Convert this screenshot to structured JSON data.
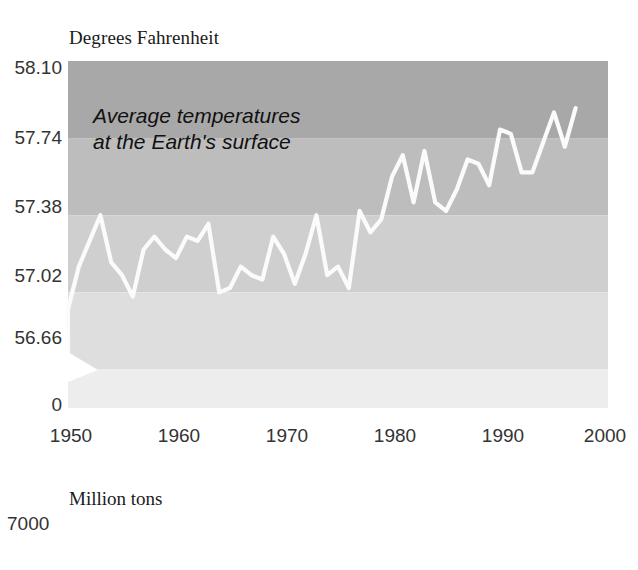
{
  "chart_data": [
    {
      "type": "line",
      "title": "Degrees Fahrenheit",
      "annotation": [
        "Average temperatures",
        "at the Earth's surface"
      ],
      "xlabel": "",
      "ylabel": "Degrees Fahrenheit",
      "yticklabels": [
        "58.10",
        "57.74",
        "57.38",
        "57.02",
        "56.66",
        "0"
      ],
      "ytickvalues": [
        58.1,
        57.74,
        57.38,
        57.02,
        56.66,
        0
      ],
      "xticklabels": [
        "1950",
        "1960",
        "1970",
        "1980",
        "1990",
        "2000"
      ],
      "xtickvalues": [
        1950,
        1960,
        1970,
        1980,
        1990,
        2000
      ],
      "xlim": [
        1950,
        2000
      ],
      "ylim": [
        56.48,
        58.1
      ],
      "axis_break": true,
      "grid": false,
      "legend": "none",
      "band_colors": [
        "#a8a8a8",
        "#bdbdbd",
        "#cfcfcf",
        "#dedede",
        "#ededed"
      ],
      "band_boundaries": [
        58.1,
        57.74,
        57.38,
        57.02,
        56.66,
        56.48
      ],
      "line_color": "#fbfbfb",
      "x": [
        1950,
        1951,
        1952,
        1953,
        1954,
        1955,
        1956,
        1957,
        1958,
        1959,
        1960,
        1961,
        1962,
        1963,
        1964,
        1965,
        1966,
        1967,
        1968,
        1969,
        1970,
        1971,
        1972,
        1973,
        1974,
        1975,
        1976,
        1977,
        1978,
        1979,
        1980,
        1981,
        1982,
        1983,
        1984,
        1985,
        1986,
        1987,
        1988,
        1989,
        1990,
        1991,
        1992,
        1993,
        1994,
        1995,
        1996,
        1997
      ],
      "values": [
        56.94,
        57.14,
        57.26,
        57.38,
        57.16,
        57.1,
        57.0,
        57.22,
        57.28,
        57.22,
        57.18,
        57.28,
        57.26,
        57.34,
        57.02,
        57.04,
        57.14,
        57.1,
        57.08,
        57.28,
        57.2,
        57.06,
        57.2,
        57.38,
        57.1,
        57.14,
        57.04,
        57.4,
        57.3,
        57.36,
        57.56,
        57.66,
        57.44,
        57.68,
        57.44,
        57.4,
        57.5,
        57.64,
        57.62,
        57.52,
        57.78,
        57.76,
        57.58,
        57.58,
        57.72,
        57.86,
        57.7,
        57.88
      ]
    },
    {
      "type": "line",
      "title": "Million tons",
      "yticklabels": [
        "7000"
      ],
      "ytickvalues": [
        7000
      ],
      "partial": true
    }
  ],
  "chart1": {
    "title": "Degrees Fahrenheit",
    "annotation_line1": "Average temperatures",
    "annotation_line2": "at the Earth's surface",
    "yticks": [
      {
        "label": "58.10",
        "top": 57
      },
      {
        "label": "57.74",
        "top": 127
      },
      {
        "label": "57.38",
        "top": 196
      },
      {
        "label": "57.02",
        "top": 265
      },
      {
        "label": "56.66",
        "top": 327
      },
      {
        "label": "0",
        "top": 394
      }
    ],
    "xticks": [
      {
        "label": "1950",
        "left": 71
      },
      {
        "label": "1960",
        "left": 179
      },
      {
        "label": "1970",
        "left": 287
      },
      {
        "label": "1980",
        "left": 395
      },
      {
        "label": "1990",
        "left": 503
      },
      {
        "label": "2000",
        "left": 605
      }
    ]
  },
  "chart2": {
    "title": "Million tons",
    "ytick": "7000"
  }
}
